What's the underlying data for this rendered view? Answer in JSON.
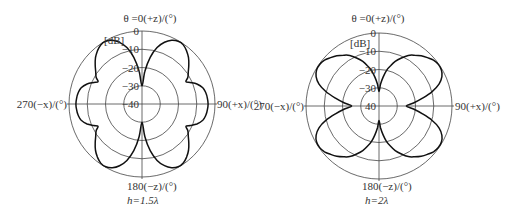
{
  "plots": [
    {
      "id": "h15",
      "center": [
        142,
        104
      ],
      "radius": 73,
      "title": "θ =0(+z)/(°)",
      "unit": "[dB]",
      "left_label": "270(−x)/(°)",
      "right_label": "90(+x)/(°)",
      "bottom_label": "180(−z)/(°)",
      "caption": "h=1.5λ",
      "ticks": [
        "0",
        "−10",
        "−20",
        "−30",
        "−40"
      ],
      "pattern_db": {
        "angles_deg": [
          0,
          5,
          10,
          15,
          20,
          25,
          30,
          35,
          40,
          45,
          50,
          55,
          60,
          63,
          66,
          70,
          75,
          80,
          85,
          90,
          95,
          100,
          105,
          110,
          114,
          117,
          120,
          125,
          130,
          135,
          140,
          145,
          150,
          155,
          160,
          165,
          170,
          175,
          180
        ],
        "values_db": [
          -30,
          -22,
          -14,
          -8,
          -4,
          -1.5,
          -0.3,
          -0.5,
          -2,
          -4,
          -6.5,
          -9,
          -11,
          -13,
          -11,
          -8,
          -5.5,
          -4.5,
          -4,
          -3.8,
          -4,
          -4.5,
          -5.5,
          -8,
          -11,
          -13,
          -11,
          -9,
          -6.5,
          -4,
          -2,
          -0.5,
          -0.3,
          -1.5,
          -4,
          -8,
          -14,
          -22,
          -30
        ]
      }
    },
    {
      "id": "h2",
      "center": [
        379,
        106
      ],
      "radius": 73,
      "title": "θ =0(+z)/(°)",
      "unit": "[dB]",
      "left_label": "270(−x)/(°)",
      "right_label": "90(+x)/(°)",
      "bottom_label": "180(−z)/(°)",
      "caption": "h=2λ",
      "ticks": [
        "0",
        "−10",
        "−20",
        "−30",
        "40"
      ],
      "pattern_db": {
        "angles_deg": [
          0,
          4,
          8,
          12,
          16,
          20,
          25,
          30,
          35,
          40,
          45,
          50,
          55,
          60,
          65,
          70,
          75,
          80,
          85,
          90,
          95,
          100,
          105,
          110,
          115,
          120,
          125,
          130,
          135,
          140,
          145,
          150,
          155,
          160,
          164,
          168,
          172,
          176,
          180
        ],
        "values_db": [
          -32,
          -28,
          -24,
          -20,
          -17,
          -14,
          -11,
          -8,
          -6,
          -4,
          -2.5,
          -1,
          -0.3,
          -0.5,
          -2,
          -5,
          -10,
          -16,
          -21,
          -25,
          -21,
          -16,
          -10,
          -5,
          -2,
          -0.5,
          -0.3,
          -1,
          -2.5,
          -4,
          -6,
          -8,
          -11,
          -14,
          -17,
          -20,
          -24,
          -28,
          -32
        ]
      }
    }
  ]
}
